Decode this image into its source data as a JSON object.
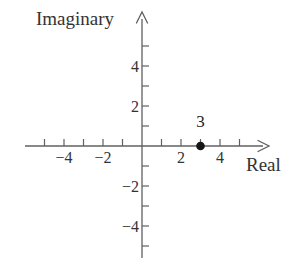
{
  "figure": {
    "background": "#ffffff",
    "axis_color": "#606060",
    "tick_color": "#606060",
    "text_color": "#333333",
    "point_color": "#151515"
  },
  "chart_data": {
    "type": "scatter",
    "title": "",
    "xlabel": "Real",
    "ylabel": "Imaginary",
    "xlim": [
      -6,
      6.5
    ],
    "ylim": [
      -5.9,
      6.7
    ],
    "grid": false,
    "legend": null,
    "x_ticks": [
      -5,
      -4,
      -3,
      -2,
      -1,
      1,
      2,
      3,
      4,
      5
    ],
    "y_ticks": [
      -5,
      -4,
      -3,
      -2,
      -1,
      1,
      2,
      3,
      4,
      5
    ],
    "x_tick_labels": [
      {
        "value": -4,
        "label": "−4"
      },
      {
        "value": -2,
        "label": "−2"
      },
      {
        "value": 2,
        "label": "2"
      },
      {
        "value": 4,
        "label": "4"
      }
    ],
    "y_tick_labels": [
      {
        "value": -4,
        "label": "−4"
      },
      {
        "value": -2,
        "label": "−2"
      },
      {
        "value": 2,
        "label": "2"
      },
      {
        "value": 4,
        "label": "4"
      }
    ],
    "points": [
      {
        "x": 3,
        "y": 0,
        "label": "3"
      }
    ]
  }
}
